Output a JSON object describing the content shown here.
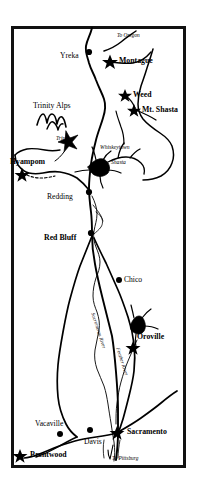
{
  "map": {
    "title": "Northern California Reference Map",
    "frame": {
      "x": 11,
      "y": 26,
      "width": 175,
      "height": 442,
      "border_color": "#111111",
      "border_width": 3
    },
    "background_color": "#ffffff",
    "ink_color": "#000000",
    "cities": [
      {
        "name": "Yreka",
        "marker": "dot",
        "label_x": 60,
        "label_y": 56,
        "marker_x": 89,
        "marker_y": 52,
        "bold": false
      },
      {
        "name": "Montague",
        "marker": "star",
        "label_x": 117,
        "label_y": 58,
        "marker_x": 110,
        "marker_y": 61,
        "bold": true
      },
      {
        "name": "Weed",
        "marker": "star",
        "label_x": 133,
        "label_y": 92,
        "marker_x": 125,
        "marker_y": 95,
        "bold": true
      },
      {
        "name": "Mt. Shasta",
        "marker": "star",
        "label_x": 142,
        "label_y": 107,
        "marker_x": 134,
        "marker_y": 110,
        "bold": true
      },
      {
        "name": "Hyampom",
        "marker": "star",
        "label_x": 11,
        "label_y": 160,
        "marker_x": 22,
        "marker_y": 174,
        "bold": true
      },
      {
        "name": "Redding",
        "marker": "dot",
        "label_x": 48,
        "label_y": 196,
        "marker_x": 89,
        "marker_y": 192,
        "bold": false
      },
      {
        "name": "Red Bluff",
        "marker": "dot",
        "label_x": 46,
        "label_y": 237,
        "marker_x": 91,
        "marker_y": 233,
        "bold": false
      },
      {
        "name": "Chico",
        "marker": "dot",
        "label_x": 124,
        "label_y": 280,
        "marker_x": 119,
        "marker_y": 280,
        "bold": false
      },
      {
        "name": "Oroville",
        "marker": "star",
        "label_x": 136,
        "label_y": 336,
        "marker_x": 133,
        "marker_y": 347,
        "bold": true
      },
      {
        "name": "Vacaville",
        "marker": "dot",
        "label_x": 36,
        "label_y": 423,
        "marker_x": 60,
        "marker_y": 434,
        "bold": false
      },
      {
        "name": "Davis",
        "marker": "dot",
        "label_x": 84,
        "label_y": 441,
        "marker_x": 90,
        "marker_y": 430,
        "bold": false
      },
      {
        "name": "Sacramento",
        "marker": "star",
        "label_x": 127,
        "label_y": 429,
        "marker_x": 117,
        "marker_y": 432,
        "bold": true
      },
      {
        "name": "Brentwood",
        "marker": "star",
        "label_x": 29,
        "label_y": 452,
        "marker_x": 20,
        "marker_y": 455,
        "bold": true
      }
    ],
    "lakes": [
      {
        "name": "Trinity",
        "label_x": 56,
        "label_y": 139
      },
      {
        "name": "Whiskeytown",
        "label_x": 101,
        "label_y": 148
      },
      {
        "name": "Shasta",
        "label_x": 111,
        "label_y": 163
      }
    ],
    "regions": [
      {
        "name": "Trinity Alps",
        "label_x": 34,
        "label_y": 106
      }
    ],
    "rivers": [
      {
        "name": "Sacramento River",
        "label_x": 95,
        "label_y": 318,
        "rotation": 72
      },
      {
        "name": "Feather River",
        "label_x": 119,
        "label_y": 352,
        "rotation": 72
      }
    ],
    "directions": [
      {
        "name": "To Oregon",
        "label_x": 117,
        "label_y": 36
      },
      {
        "name": "To Pittsburg",
        "label_x": 112,
        "label_y": 459
      }
    ]
  }
}
